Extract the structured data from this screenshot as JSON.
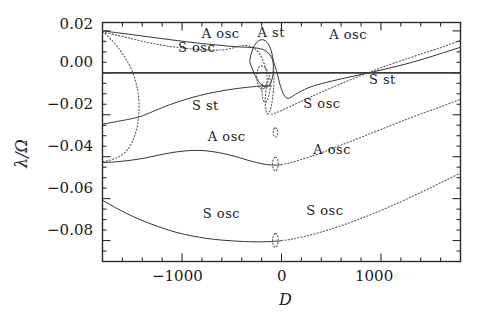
{
  "chart_data": {
    "type": "line",
    "title": "",
    "xlabel": "D",
    "ylabel": "λ/Ω",
    "xlim": [
      -1800,
      1800
    ],
    "ylim": [
      -0.09,
      0.024
    ],
    "grid": false,
    "legend": "none",
    "x_ticks_major": [
      -1000,
      0,
      1000
    ],
    "x_tick_labels": [
      "−1000",
      "0",
      "1000"
    ],
    "x_minor_tick_step": 200,
    "y_ticks_major": [
      0.02,
      0.0,
      -0.02,
      -0.04,
      -0.06,
      -0.08
    ],
    "y_tick_labels": [
      "0.02",
      "0.00",
      "−0.02",
      "−0.04",
      "−0.06",
      "−0.08"
    ],
    "y_minor_tick_step": 0.005,
    "annotations": [
      {
        "text": "A osc",
        "x": -620,
        "y": 0.0185,
        "id": "a-osc-top-left"
      },
      {
        "text": "S osc",
        "x": -860,
        "y": 0.0118,
        "id": "s-osc-top-left"
      },
      {
        "text": "A st",
        "x": -60,
        "y": 0.0192,
        "id": "a-st-top"
      },
      {
        "text": "A osc",
        "x": 660,
        "y": 0.0178,
        "id": "a-osc-top-right"
      },
      {
        "text": "S st",
        "x": 1060,
        "y": -0.0035,
        "id": "s-st-right"
      },
      {
        "text": "S st",
        "x": -720,
        "y": -0.0158,
        "id": "s-st-left"
      },
      {
        "text": "S osc",
        "x": 400,
        "y": -0.0148,
        "id": "s-osc-right"
      },
      {
        "text": "A osc",
        "x": -560,
        "y": -0.0305,
        "id": "a-osc-mid-left"
      },
      {
        "text": "A osc",
        "x": 500,
        "y": -0.0368,
        "id": "a-osc-mid-right"
      },
      {
        "text": "S osc",
        "x": -610,
        "y": -0.0672,
        "id": "s-osc-low-left"
      },
      {
        "text": "S osc",
        "x": 430,
        "y": -0.066,
        "id": "s-osc-low-right"
      }
    ],
    "series": [
      {
        "name": "A-osc upper branch (solid, from top-left descending)",
        "style": "solid",
        "points": [
          [
            -1800,
            0.02
          ],
          [
            -1500,
            0.0182
          ],
          [
            -1200,
            0.0163
          ],
          [
            -900,
            0.0145
          ],
          [
            -700,
            0.0135
          ],
          [
            -500,
            0.0126
          ],
          [
            -350,
            0.0122
          ],
          [
            -250,
            0.0118
          ],
          [
            -180,
            0.011
          ],
          [
            -120,
            0.0088
          ],
          [
            -80,
            0.0052
          ],
          [
            -50,
            0.001
          ],
          [
            -35,
            -0.002
          ],
          [
            -20,
            -0.0048
          ],
          [
            0,
            -0.0078
          ],
          [
            20,
            -0.0102
          ],
          [
            45,
            -0.0118
          ],
          [
            70,
            -0.0122
          ],
          [
            110,
            -0.0112
          ],
          [
            180,
            -0.0092
          ],
          [
            300,
            -0.0066
          ],
          [
            500,
            -0.004
          ],
          [
            800,
            -0.0008
          ],
          [
            1100,
            0.0024
          ],
          [
            1400,
            0.0062
          ],
          [
            1800,
            0.0122
          ]
        ]
      },
      {
        "name": "S-osc upper branch (dotted, from top-left)",
        "style": "dotted",
        "points": [
          [
            -1800,
            0.0195
          ],
          [
            -1550,
            0.0168
          ],
          [
            -1350,
            0.0145
          ],
          [
            -1150,
            0.0128
          ],
          [
            -950,
            0.0116
          ],
          [
            -800,
            0.011
          ],
          [
            -680,
            0.0108
          ],
          [
            -580,
            0.011
          ],
          [
            -500,
            0.0117
          ],
          [
            -430,
            0.0126
          ],
          [
            -360,
            0.013
          ],
          [
            -300,
            0.0124
          ],
          [
            -250,
            0.0108
          ],
          [
            -210,
            0.0082
          ],
          [
            -180,
            0.0052
          ],
          [
            -160,
            0.0022
          ],
          [
            -150,
            0.0
          ],
          [
            -145,
            -0.0022
          ],
          [
            -150,
            -0.0048
          ],
          [
            -165,
            -0.0068
          ],
          [
            -190,
            -0.0078
          ],
          [
            -215,
            -0.0074
          ],
          [
            -235,
            -0.0058
          ],
          [
            -245,
            -0.0036
          ],
          [
            -248,
            -0.0012
          ],
          [
            -242,
            0.001
          ],
          [
            -228,
            0.0026
          ],
          [
            -205,
            0.0032
          ],
          [
            -175,
            0.0028
          ],
          [
            -150,
            0.0016
          ],
          [
            -130,
            0.0
          ],
          [
            -118,
            -0.002
          ],
          [
            -112,
            -0.0046
          ],
          [
            -115,
            -0.0076
          ],
          [
            -125,
            -0.0104
          ],
          [
            -140,
            -0.0128
          ],
          [
            -158,
            -0.014
          ],
          [
            -175,
            -0.0138
          ],
          [
            -188,
            -0.0124
          ],
          [
            -195,
            -0.01
          ],
          [
            -196,
            -0.0072
          ],
          [
            -190,
            -0.0046
          ]
        ]
      },
      {
        "name": "A-st closed loop (solid, above zero near D=-200)",
        "style": "solid",
        "points": [
          [
            -320,
            0.0058
          ],
          [
            -300,
            0.0098
          ],
          [
            -272,
            0.013
          ],
          [
            -238,
            0.015
          ],
          [
            -200,
            0.0158
          ],
          [
            -160,
            0.0152
          ],
          [
            -126,
            0.0132
          ],
          [
            -100,
            0.01
          ],
          [
            -86,
            0.0062
          ],
          [
            -82,
            0.0022
          ],
          [
            -88,
            -0.0014
          ],
          [
            -104,
            -0.0044
          ],
          [
            -128,
            -0.0062
          ],
          [
            -160,
            -0.0068
          ],
          [
            -196,
            -0.006
          ],
          [
            -232,
            -0.004
          ],
          [
            -264,
            -0.0014
          ],
          [
            -292,
            0.0018
          ],
          [
            -312,
            0.0042
          ],
          [
            -320,
            0.0058
          ]
        ]
      },
      {
        "name": "A-st loop right dotted continuation",
        "style": "dotted",
        "points": [
          [
            -100,
            0.01
          ],
          [
            -86,
            0.0062
          ],
          [
            -78,
            0.0018
          ],
          [
            -76,
            -0.0028
          ],
          [
            -80,
            -0.0076
          ],
          [
            -90,
            -0.0122
          ],
          [
            -104,
            -0.016
          ],
          [
            -120,
            -0.0186
          ],
          [
            -136,
            -0.0196
          ],
          [
            -150,
            -0.019
          ],
          [
            -160,
            -0.0168
          ],
          [
            -164,
            -0.0136
          ],
          [
            -160,
            -0.01
          ],
          [
            -150,
            -0.0066
          ],
          [
            -136,
            -0.0038
          ],
          [
            -120,
            -0.0018
          ]
        ]
      },
      {
        "name": "S-st branch (solid, rising from lower-left to zero crossing)",
        "style": "solid",
        "points": [
          [
            -1800,
            -0.0245
          ],
          [
            -1650,
            -0.0232
          ],
          [
            -1520,
            -0.022
          ],
          [
            -1430,
            -0.021
          ],
          [
            -1370,
            -0.02
          ],
          [
            -1300,
            -0.0186
          ],
          [
            -1200,
            -0.0166
          ],
          [
            -1050,
            -0.014
          ],
          [
            -900,
            -0.0118
          ],
          [
            -750,
            -0.01
          ],
          [
            -600,
            -0.0086
          ],
          [
            -450,
            -0.0075
          ],
          [
            -320,
            -0.0068
          ],
          [
            -230,
            -0.0064
          ],
          [
            -160,
            -0.0062
          ],
          [
            -120,
            -0.0062
          ],
          [
            -100,
            -0.0064
          ]
        ]
      },
      {
        "name": "S-st branch continuation right (dotted, crossing zero near D=700)",
        "style": "dotted",
        "points": [
          [
            -100,
            -0.0198
          ],
          [
            -60,
            -0.0192
          ],
          [
            0,
            -0.018
          ],
          [
            80,
            -0.0162
          ],
          [
            180,
            -0.014
          ],
          [
            300,
            -0.0114
          ],
          [
            430,
            -0.0086
          ],
          [
            560,
            -0.006
          ],
          [
            700,
            -0.0032
          ],
          [
            850,
            -0.0004
          ],
          [
            1000,
            0.0024
          ],
          [
            1180,
            0.0054
          ],
          [
            1380,
            0.0086
          ],
          [
            1600,
            0.012
          ],
          [
            1800,
            0.0154
          ]
        ]
      },
      {
        "name": "Dotted bifurcation arc near D=-1400 upper",
        "style": "dotted",
        "points": [
          [
            -1800,
            0.0198
          ],
          [
            -1700,
            0.0152
          ],
          [
            -1620,
            0.0106
          ],
          [
            -1560,
            0.0062
          ],
          [
            -1510,
            0.0018
          ],
          [
            -1475,
            -0.0028
          ],
          [
            -1450,
            -0.0074
          ],
          [
            -1436,
            -0.012
          ],
          [
            -1432,
            -0.0166
          ],
          [
            -1438,
            -0.0212
          ],
          [
            -1452,
            -0.0258
          ],
          [
            -1476,
            -0.03
          ],
          [
            -1508,
            -0.0336
          ],
          [
            -1548,
            -0.0366
          ],
          [
            -1600,
            -0.039
          ],
          [
            -1670,
            -0.0408
          ],
          [
            -1750,
            -0.042
          ],
          [
            -1800,
            -0.0424
          ]
        ]
      },
      {
        "name": "A-osc middle branch (solid, deep curve with minimum near D=-250)",
        "style": "solid",
        "points": [
          [
            -1800,
            -0.0428
          ],
          [
            -1650,
            -0.0424
          ],
          [
            -1500,
            -0.0416
          ],
          [
            -1370,
            -0.0406
          ],
          [
            -1250,
            -0.0394
          ],
          [
            -1120,
            -0.0382
          ],
          [
            -1000,
            -0.0374
          ],
          [
            -880,
            -0.037
          ],
          [
            -760,
            -0.0372
          ],
          [
            -640,
            -0.038
          ],
          [
            -520,
            -0.0392
          ],
          [
            -400,
            -0.0408
          ],
          [
            -300,
            -0.0422
          ],
          [
            -210,
            -0.0432
          ],
          [
            -140,
            -0.0438
          ],
          [
            -80,
            -0.044
          ],
          [
            -40,
            -0.044
          ],
          [
            0,
            -0.0438
          ]
        ]
      },
      {
        "name": "A-osc middle branch right (dotted, rising to the right)",
        "style": "dotted",
        "points": [
          [
            0,
            -0.0438
          ],
          [
            80,
            -0.043
          ],
          [
            180,
            -0.0416
          ],
          [
            300,
            -0.0398
          ],
          [
            430,
            -0.0376
          ],
          [
            560,
            -0.0352
          ],
          [
            700,
            -0.0326
          ],
          [
            850,
            -0.0298
          ],
          [
            1000,
            -0.027
          ],
          [
            1180,
            -0.0236
          ],
          [
            1380,
            -0.02
          ],
          [
            1600,
            -0.0162
          ],
          [
            1800,
            -0.0126
          ]
        ]
      },
      {
        "name": "S-osc lower branch (solid, minimum near D=-300)",
        "style": "solid",
        "points": [
          [
            -1800,
            -0.0608
          ],
          [
            -1650,
            -0.0648
          ],
          [
            -1500,
            -0.0684
          ],
          [
            -1350,
            -0.0714
          ],
          [
            -1200,
            -0.074
          ],
          [
            -1050,
            -0.0762
          ],
          [
            -900,
            -0.0778
          ],
          [
            -750,
            -0.079
          ],
          [
            -600,
            -0.0798
          ],
          [
            -450,
            -0.0803
          ],
          [
            -300,
            -0.0806
          ],
          [
            -180,
            -0.0806
          ],
          [
            -80,
            -0.0804
          ],
          [
            -20,
            -0.0802
          ],
          [
            0,
            -0.08
          ]
        ]
      },
      {
        "name": "S-osc lower branch right (dotted, rising to the right)",
        "style": "dotted",
        "points": [
          [
            0,
            -0.08
          ],
          [
            100,
            -0.0794
          ],
          [
            220,
            -0.0782
          ],
          [
            350,
            -0.0766
          ],
          [
            480,
            -0.0748
          ],
          [
            620,
            -0.0726
          ],
          [
            770,
            -0.07
          ],
          [
            920,
            -0.0672
          ],
          [
            1080,
            -0.064
          ],
          [
            1250,
            -0.0604
          ],
          [
            1430,
            -0.0564
          ],
          [
            1620,
            -0.052
          ],
          [
            1800,
            -0.0478
          ]
        ]
      },
      {
        "name": "small loop A-osc near D=-60",
        "style": "dotted",
        "points": [
          [
            -60,
            -0.0402
          ],
          [
            -42,
            -0.041
          ],
          [
            -34,
            -0.0424
          ],
          [
            -34,
            -0.0442
          ],
          [
            -42,
            -0.0458
          ],
          [
            -58,
            -0.0468
          ],
          [
            -76,
            -0.0464
          ],
          [
            -88,
            -0.045
          ],
          [
            -90,
            -0.0432
          ],
          [
            -82,
            -0.0414
          ],
          [
            -68,
            -0.0404
          ],
          [
            -60,
            -0.0402
          ]
        ]
      },
      {
        "name": "small loop S-osc near D=-60",
        "style": "dotted",
        "points": [
          [
            -60,
            -0.0766
          ],
          [
            -42,
            -0.0774
          ],
          [
            -34,
            -0.0788
          ],
          [
            -34,
            -0.0806
          ],
          [
            -42,
            -0.0822
          ],
          [
            -58,
            -0.0832
          ],
          [
            -76,
            -0.0828
          ],
          [
            -88,
            -0.0814
          ],
          [
            -90,
            -0.0796
          ],
          [
            -82,
            -0.0778
          ],
          [
            -68,
            -0.0768
          ],
          [
            -60,
            -0.0766
          ]
        ]
      },
      {
        "name": "small loop upper near D=-60 at -0.028",
        "style": "dotted",
        "points": [
          [
            -62,
            -0.0262
          ],
          [
            -46,
            -0.0268
          ],
          [
            -38,
            -0.028
          ],
          [
            -40,
            -0.0294
          ],
          [
            -52,
            -0.0304
          ],
          [
            -68,
            -0.0306
          ],
          [
            -80,
            -0.0298
          ],
          [
            -84,
            -0.0284
          ],
          [
            -78,
            -0.027
          ],
          [
            -70,
            -0.0263
          ],
          [
            -62,
            -0.0262
          ]
        ]
      },
      {
        "name": "zero reference line",
        "style": "solid-thick",
        "points": [
          [
            -1800,
            0.0
          ],
          [
            1800,
            0.0
          ]
        ]
      }
    ]
  },
  "axis": {
    "y_title": "λ/Ω",
    "x_title": "D"
  }
}
